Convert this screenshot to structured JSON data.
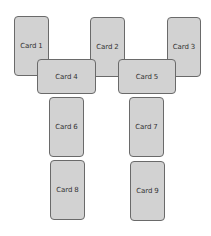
{
  "diagram": {
    "cards": [
      {
        "label": "Card 1",
        "x": 14,
        "y": 16,
        "w": 35,
        "h": 60
      },
      {
        "label": "Card 2",
        "x": 90,
        "y": 17,
        "w": 35,
        "h": 60
      },
      {
        "label": "Card 3",
        "x": 167,
        "y": 17,
        "w": 34,
        "h": 60
      },
      {
        "label": "Card 4",
        "x": 37,
        "y": 59,
        "w": 59,
        "h": 35
      },
      {
        "label": "Card 5",
        "x": 118,
        "y": 59,
        "w": 58,
        "h": 35
      },
      {
        "label": "Card 6",
        "x": 49,
        "y": 97,
        "w": 35,
        "h": 60
      },
      {
        "label": "Card 7",
        "x": 129,
        "y": 97,
        "w": 35,
        "h": 60
      },
      {
        "label": "Card 8",
        "x": 50,
        "y": 160,
        "w": 35,
        "h": 60
      },
      {
        "label": "Card 9",
        "x": 130,
        "y": 161,
        "w": 35,
        "h": 60
      }
    ],
    "colors": {
      "card_fill": "#d2d2d2",
      "card_border": "#6a6a6a",
      "text": "#333333",
      "background": "#ffffff"
    }
  }
}
